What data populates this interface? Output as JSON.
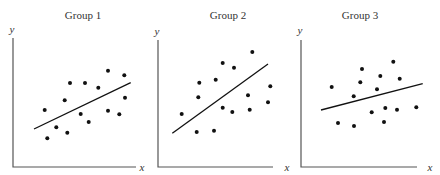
{
  "chart_data": [
    {
      "type": "scatter",
      "title": "Group 1",
      "xlabel": "x",
      "ylabel": "y",
      "grid": false,
      "ticks": false,
      "frame": {
        "x0": 13,
        "y_top": 38,
        "y_axis": 167,
        "x_end": 136
      },
      "points": [
        [
          44.7,
          110
        ],
        [
          47.3,
          138.3
        ],
        [
          56.3,
          127.3
        ],
        [
          67.3,
          132.7
        ],
        [
          64.7,
          100.3
        ],
        [
          70,
          83
        ],
        [
          85,
          83
        ],
        [
          80.7,
          114
        ],
        [
          88.7,
          122
        ],
        [
          98.3,
          87.7
        ],
        [
          108,
          70.7
        ],
        [
          108,
          110.7
        ],
        [
          119.3,
          114.3
        ],
        [
          124.3,
          75.3
        ],
        [
          125,
          97.7
        ]
      ],
      "fit_line": [
        [
          34,
          129
        ],
        [
          130.7,
          82.7
        ]
      ],
      "trend": "positive, moderate slope"
    },
    {
      "type": "scatter",
      "title": "Group 2",
      "xlabel": "x",
      "ylabel": "y",
      "grid": false,
      "ticks": false,
      "frame": {
        "x0": 158,
        "y_top": 40,
        "y_axis": 167,
        "x_end": 273
      },
      "points": [
        [
          181.7,
          114
        ],
        [
          196.7,
          132
        ],
        [
          214,
          130.7
        ],
        [
          198.3,
          97.3
        ],
        [
          199.3,
          82.7
        ],
        [
          215.7,
          79.7
        ],
        [
          222.7,
          63
        ],
        [
          234,
          67.7
        ],
        [
          252.3,
          52
        ],
        [
          222.7,
          107.7
        ],
        [
          232.3,
          112
        ],
        [
          248,
          95.3
        ],
        [
          249.7,
          109.7
        ],
        [
          268,
          102.3
        ],
        [
          270.3,
          86.3
        ]
      ],
      "fit_line": [
        [
          172.3,
          133.3
        ],
        [
          268,
          64
        ]
      ],
      "trend": "positive, steep slope"
    },
    {
      "type": "scatter",
      "title": "Group 3",
      "xlabel": "x",
      "ylabel": "y",
      "grid": false,
      "ticks": false,
      "frame": {
        "x0": 301,
        "y_top": 40,
        "y_axis": 167,
        "x_end": 417
      },
      "points": [
        [
          331.7,
          87
        ],
        [
          338,
          123
        ],
        [
          354,
          126
        ],
        [
          353.7,
          96.3
        ],
        [
          360.3,
          82.3
        ],
        [
          362,
          69
        ],
        [
          371.7,
          112.3
        ],
        [
          377,
          89.3
        ],
        [
          380.3,
          76
        ],
        [
          384,
          122
        ],
        [
          385.3,
          108
        ],
        [
          393.3,
          61.7
        ],
        [
          397,
          109.7
        ],
        [
          399.7,
          78.7
        ],
        [
          416.3,
          107.3
        ]
      ],
      "fit_line": [
        [
          321,
          110
        ],
        [
          422.7,
          83.7
        ]
      ],
      "trend": "positive, shallow slope"
    }
  ],
  "panels": [
    {
      "title": "Group 1",
      "xlabel": "x",
      "ylabel": "y",
      "title_x": 83,
      "ylabel_pos": [
        12,
        33
      ],
      "xlabel_pos": [
        142,
        171
      ]
    },
    {
      "title": "Group 2",
      "xlabel": "x",
      "ylabel": "y",
      "title_x": 228,
      "ylabel_pos": [
        157,
        35
      ],
      "xlabel_pos": [
        287,
        171
      ]
    },
    {
      "title": "Group 3",
      "xlabel": "x",
      "ylabel": "y",
      "title_x": 360,
      "ylabel_pos": [
        300,
        34
      ],
      "xlabel_pos": [
        430,
        171
      ]
    }
  ]
}
